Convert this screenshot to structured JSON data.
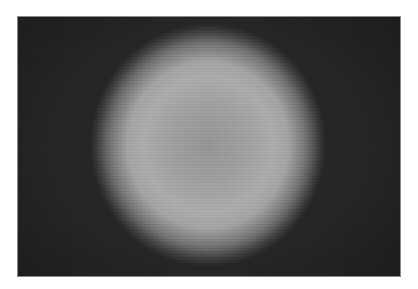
{
  "image": {
    "description": "Grainy grayscale photograph of a diffuse bright circular halo on a dark background",
    "colors": {
      "background_frame": "#262626",
      "halo_center": "#969696",
      "halo_ring": "#acacac",
      "page_background": "#ffffff"
    }
  }
}
